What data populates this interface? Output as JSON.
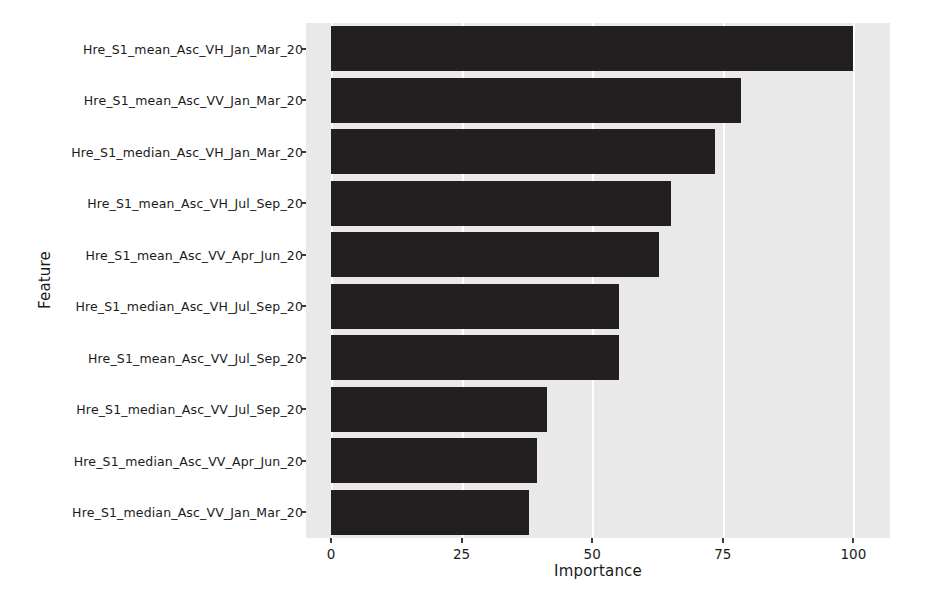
{
  "chart_data": {
    "type": "bar",
    "orientation": "horizontal",
    "title": "",
    "xlabel": "Importance",
    "ylabel": "Feature",
    "xlim": [
      0,
      107
    ],
    "xticks": [
      0,
      25,
      50,
      75,
      100
    ],
    "xtick_labels": [
      "0",
      "25",
      "50",
      "75",
      "100"
    ],
    "grid": true,
    "grid_axis": "x",
    "legend": "none",
    "bar_color": "#231f20",
    "plot_background": "#e9e9e9",
    "gridline_color": "#ffffff",
    "categories": [
      "Hre_S1_mean_Asc_VH_Jan_Mar_20",
      "Hre_S1_mean_Asc_VV_Jan_Mar_20",
      "Hre_S1_median_Asc_VH_Jan_Mar_20",
      "Hre_S1_mean_Asc_VH_Jul_Sep_20",
      "Hre_S1_mean_Asc_VV_Apr_Jun_20",
      "Hre_S1_median_Asc_VH_Jul_Sep_20",
      "Hre_S1_mean_Asc_VV_Jul_Sep_20",
      "Hre_S1_median_Asc_VV_Jul_Sep_20",
      "Hre_S1_median_Asc_VV_Apr_Jun_20",
      "Hre_S1_median_Asc_VV_Jan_Mar_20"
    ],
    "values": [
      100,
      78.5,
      73.5,
      65,
      62.7,
      55.2,
      55.2,
      41.4,
      39.5,
      37.9
    ]
  }
}
